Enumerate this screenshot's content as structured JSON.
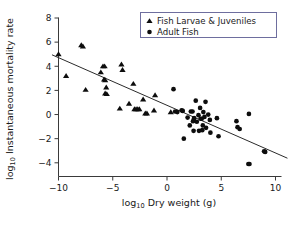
{
  "chart_data": {
    "type": "scatter",
    "title": "",
    "xlabel": "log10 Dry weight (g)",
    "ylabel": "log10 Instantaneous mortality rate",
    "xlabel_base": "log",
    "xlabel_sub": "10",
    "xlabel_rest": " Dry weight (g)",
    "ylabel_base": "log",
    "ylabel_sub": "10",
    "ylabel_rest": " Instantaneous mortality rate",
    "xlim": [
      -11.5,
      11.5
    ],
    "ylim": [
      -5.0,
      8.3
    ],
    "xticks": [
      -10,
      -5,
      0,
      5,
      10
    ],
    "xtick_labels": [
      "−10",
      "−5",
      "0",
      "5",
      "10"
    ],
    "yticks": [
      -4,
      -2,
      0,
      2,
      4,
      6,
      8
    ],
    "ytick_labels": [
      "−4",
      "−2",
      "0",
      "2",
      "4",
      "6",
      "8"
    ],
    "grid": false,
    "legend_position": "top-right",
    "marker_color": "#0d0d0d",
    "line_color": "#2b2b2b",
    "trendline": {
      "label": "regression line",
      "x_start": -10.6,
      "y_start": 4.95,
      "x_end": 11.1,
      "y_end": -3.62,
      "slope": -0.395,
      "intercept": 0.76
    },
    "series": [
      {
        "name": "Fish Larvae & Juveniles",
        "marker": "triangle",
        "points": [
          [
            -10.0,
            5.0
          ],
          [
            -9.3,
            3.2
          ],
          [
            -7.9,
            5.75
          ],
          [
            -7.75,
            5.65
          ],
          [
            -7.5,
            2.05
          ],
          [
            -6.1,
            3.5
          ],
          [
            -5.9,
            4.0
          ],
          [
            -5.75,
            4.0
          ],
          [
            -5.8,
            2.9
          ],
          [
            -5.7,
            2.85
          ],
          [
            -5.7,
            1.75
          ],
          [
            -5.55,
            1.7
          ],
          [
            -5.6,
            2.25
          ],
          [
            -4.2,
            4.15
          ],
          [
            -4.1,
            3.7
          ],
          [
            -4.35,
            0.5
          ],
          [
            -3.5,
            0.9
          ],
          [
            -3.1,
            2.55
          ],
          [
            -3.0,
            0.45
          ],
          [
            -2.85,
            0.45
          ],
          [
            -2.7,
            0.45
          ],
          [
            -2.55,
            0.45
          ],
          [
            -2.2,
            1.25
          ],
          [
            -2.0,
            0.1
          ],
          [
            -1.85,
            0.1
          ],
          [
            -1.1,
            1.6
          ],
          [
            -1.2,
            0.35
          ],
          [
            0.35,
            0.2
          ]
        ]
      },
      {
        "name": "Adult Fish",
        "marker": "circle",
        "points": [
          [
            0.6,
            2.1
          ],
          [
            0.75,
            0.25
          ],
          [
            0.95,
            0.2
          ],
          [
            1.35,
            0.35
          ],
          [
            1.45,
            0.3
          ],
          [
            1.55,
            -2.0
          ],
          [
            1.9,
            -0.25
          ],
          [
            2.1,
            -0.9
          ],
          [
            2.2,
            0.25
          ],
          [
            2.35,
            0.25
          ],
          [
            2.4,
            -0.55
          ],
          [
            2.45,
            -1.35
          ],
          [
            2.5,
            -0.3
          ],
          [
            2.65,
            1.15
          ],
          [
            2.75,
            -0.6
          ],
          [
            2.9,
            -0.05
          ],
          [
            2.95,
            -1.35
          ],
          [
            3.05,
            0.55
          ],
          [
            3.1,
            -0.35
          ],
          [
            3.2,
            -0.35
          ],
          [
            3.25,
            -1.3
          ],
          [
            3.3,
            -0.9
          ],
          [
            3.35,
            0.2
          ],
          [
            3.45,
            -0.2
          ],
          [
            3.55,
            1.05
          ],
          [
            3.6,
            -1.1
          ],
          [
            3.8,
            0.0
          ],
          [
            3.95,
            -0.45
          ],
          [
            4.0,
            -1.5
          ],
          [
            4.6,
            -0.3
          ],
          [
            4.75,
            -1.8
          ],
          [
            6.4,
            -0.55
          ],
          [
            6.5,
            -1.05
          ],
          [
            6.7,
            -1.2
          ],
          [
            7.55,
            0.05
          ],
          [
            7.5,
            -4.1
          ],
          [
            7.6,
            -4.1
          ],
          [
            8.95,
            -3.05
          ],
          [
            9.05,
            -3.1
          ]
        ]
      }
    ]
  },
  "legend": {
    "entries": [
      {
        "label": "Fish Larvae & Juveniles",
        "marker": "triangle"
      },
      {
        "label": "Adult Fish",
        "marker": "circle"
      }
    ]
  }
}
